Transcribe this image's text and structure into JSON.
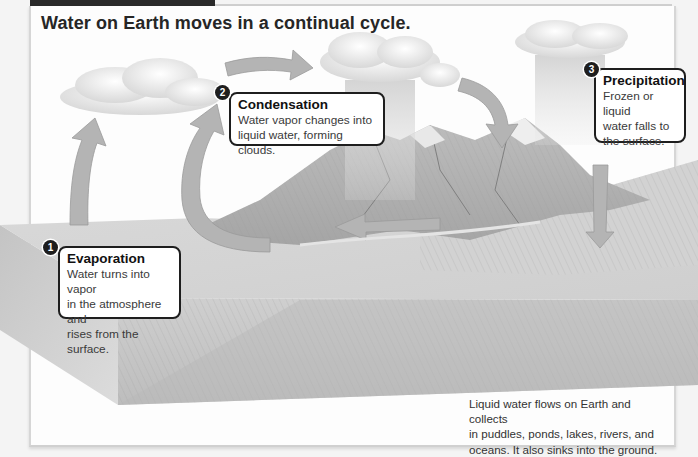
{
  "header": {
    "title": "Water on Earth moves in a continual cycle."
  },
  "callouts": [
    {
      "number": "1",
      "title": "Evaporation",
      "lines": [
        "Water turns into vapor",
        "in the atmosphere and",
        "rises from the surface."
      ]
    },
    {
      "number": "2",
      "title": "Condensation",
      "lines": [
        "Water vapor changes into",
        "liquid water, forming clouds."
      ]
    },
    {
      "number": "3",
      "title": "Precipitation",
      "lines": [
        "Frozen or liquid",
        "water falls to",
        "the surface."
      ]
    }
  ],
  "caption": {
    "lines": [
      "Liquid water flows on Earth and collects",
      "in puddles, ponds, lakes, rivers, and",
      "oceans. It also sinks into the ground."
    ]
  },
  "scene": {
    "elements": [
      "cloud-left",
      "cloud-middle-raining",
      "cloud-right-raining",
      "mountains",
      "ocean-block",
      "river"
    ],
    "arrows": [
      "evaporation-arrow-left",
      "evaporation-arrow-loop",
      "cloud-transfer-arrow",
      "descending-arrow",
      "precipitation-arrow",
      "river-flow-arrow"
    ]
  },
  "colors": {
    "frame_tab": "#2a2a2a",
    "callout_border": "#1e1e1e",
    "arrow_fill": "#b4b4b4",
    "cloud": "#eeeeee",
    "ocean_side": "#c8c8c8"
  }
}
